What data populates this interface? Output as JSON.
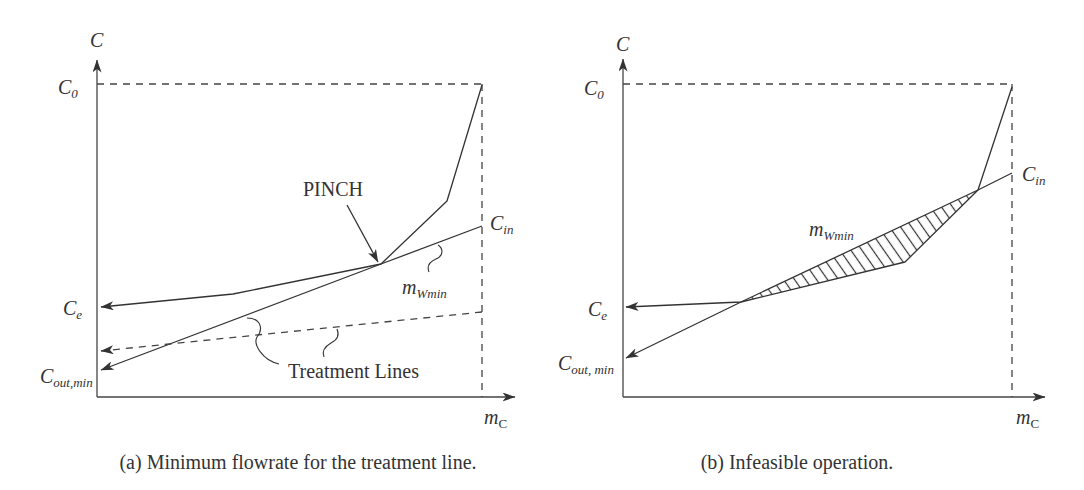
{
  "panels": [
    {
      "id": "a",
      "caption": "(a) Minimum flowrate for the treatment line.",
      "y_axis_label": "C",
      "x_axis_label": {
        "main": "m",
        "sub": "C"
      },
      "labels": {
        "c0": {
          "main": "C",
          "sub": "0"
        },
        "cin": {
          "main": "C",
          "sub": "in"
        },
        "ce": {
          "main": "C",
          "sub": "e"
        },
        "cout_min": {
          "main": "C",
          "sub": "out,min"
        },
        "mwmin": {
          "main": "m",
          "sub": "Wmin"
        }
      },
      "annotations": {
        "pinch": "PINCH",
        "treatment_lines": "Treatment Lines"
      },
      "curves": {
        "composite": "482,85 447,201 381,264 233,294 101,307",
        "treatment_min": "482,226 381,264 101,370",
        "treatment_alt": "482,312 101,351"
      }
    },
    {
      "id": "b",
      "caption": "(b) Infeasible operation.",
      "y_axis_label": "C",
      "x_axis_label": {
        "main": "m",
        "sub": "C"
      },
      "labels": {
        "c0": {
          "main": "C",
          "sub": "0"
        },
        "cin": {
          "main": "C",
          "sub": "in"
        },
        "ce": {
          "main": "C",
          "sub": "e"
        },
        "cout_min": {
          "main": "C",
          "sub": "out, min"
        },
        "mwmin": {
          "main": "m",
          "sub": "Wmin"
        }
      },
      "curves": {
        "composite": "1012,87 978,190 905,262 741,302 626,307",
        "treatment_min": "1012,173 978,190 741,302 626,358",
        "infeasible_region": "741,302 978,190 905,262"
      }
    }
  ]
}
